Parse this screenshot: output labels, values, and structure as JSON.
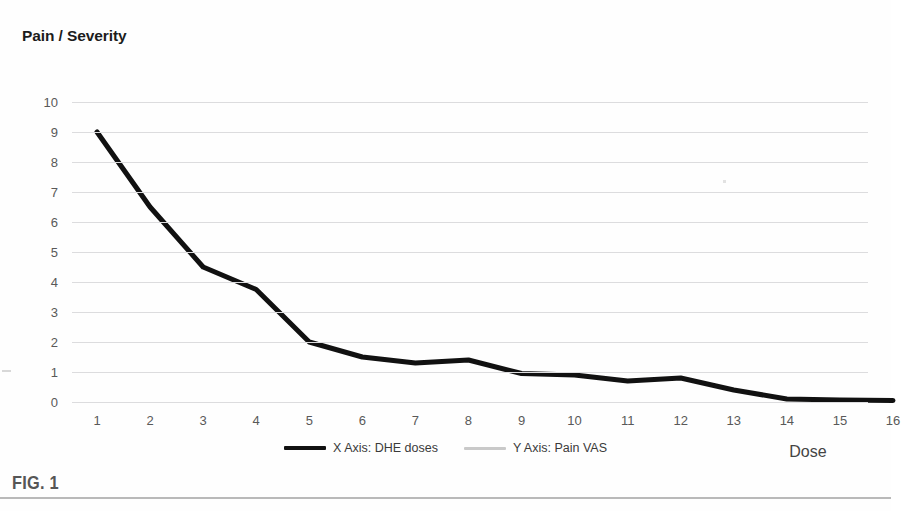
{
  "figure": {
    "caption": "FIG. 1"
  },
  "chart_data": {
    "type": "line",
    "title": "Pain / Severity",
    "xlabel": "Dose",
    "ylabel": "Pain / Severity",
    "xlim": [
      1,
      16
    ],
    "ylim": [
      0,
      10
    ],
    "grid": true,
    "legend_position": "bottom",
    "x_tick_labels": [
      "1",
      "2",
      "3",
      "4",
      "5",
      "6",
      "7",
      "8",
      "9",
      "10",
      "11",
      "12",
      "13",
      "14",
      "15",
      "16"
    ],
    "y_tick_labels": [
      "0",
      "1",
      "2",
      "3",
      "4",
      "5",
      "6",
      "7",
      "8",
      "9",
      "10"
    ],
    "x": [
      1,
      2,
      3,
      4,
      5,
      6,
      7,
      8,
      9,
      10,
      11,
      12,
      13,
      14,
      15,
      16
    ],
    "series": [
      {
        "name": "X Axis: DHE doses",
        "color": "#111111",
        "values": [
          9.0,
          6.5,
          4.5,
          3.75,
          2.0,
          1.5,
          1.3,
          1.4,
          0.95,
          0.9,
          0.7,
          0.8,
          0.4,
          0.1,
          0.07,
          0.05
        ]
      }
    ],
    "legend": [
      {
        "label": "X Axis: DHE doses",
        "color": "#111111",
        "style": "thick"
      },
      {
        "label": "Y Axis: Pain VAS",
        "color": "#c9c9c9",
        "style": "thin"
      }
    ],
    "colors": {
      "gridline": "#dcdcde",
      "tick_text": "#595959",
      "series_primary": "#111111",
      "series_secondary": "#c9c9c9",
      "caption": "#565656"
    }
  }
}
